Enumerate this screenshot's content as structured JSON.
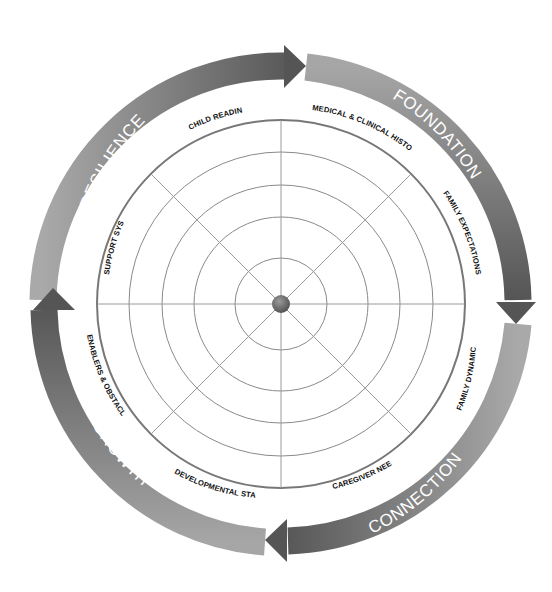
{
  "diagram": {
    "type": "circular assessment wheel",
    "center": {
      "x": 281,
      "y": 304
    },
    "grid": {
      "ring_radii": [
        46,
        87,
        119,
        152,
        184
      ],
      "spokes": 8,
      "line_color": "#888888",
      "outer_ring_color": "#777777",
      "center_dot_color": "#6a6a6a"
    },
    "band": {
      "outer_radius": 251,
      "inner_radius": 224,
      "light_color": "#b4b4b4",
      "dark_color": "#5f5f5f"
    },
    "quadrants": [
      {
        "label": "FOUNDATION"
      },
      {
        "label": "CONNECTION"
      },
      {
        "label": "GROWTH"
      },
      {
        "label": "RESILIENCE"
      }
    ],
    "segments": [
      {
        "label": "MEDICAL & CLINICAL HISTORY"
      },
      {
        "label": "FAMILY EXPECTATIONS"
      },
      {
        "label": "FAMILY DYNAMICS"
      },
      {
        "label": "CAREGIVER NEEDS"
      },
      {
        "label": "DEVELOPMENTAL STAGE"
      },
      {
        "label": "ENABLERS & OBSTACLES"
      },
      {
        "label": "SUPPORT SYSTEMS"
      },
      {
        "label": "CHILD READINESS"
      }
    ]
  }
}
